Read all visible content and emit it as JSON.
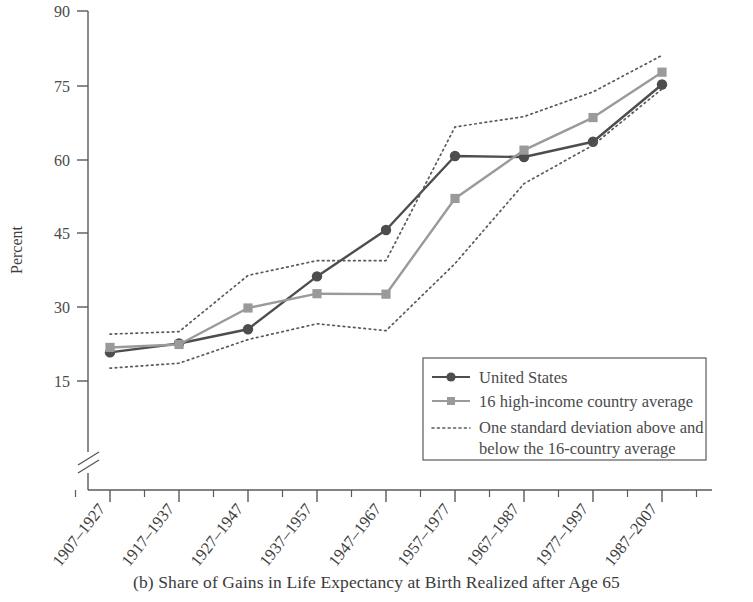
{
  "caption": "(b) Share of Gains in Life Expectancy at Birth Realized after Age 65",
  "axis": {
    "ylabel": "Percent",
    "yticks": [
      "15",
      "30",
      "45",
      "60",
      "75",
      "90"
    ],
    "break_symbol": "axis-break"
  },
  "legend": {
    "items": [
      {
        "label": "United States",
        "marker": "circle",
        "style": "solid",
        "color": "#4d4d4d"
      },
      {
        "label": "16 high-income country average",
        "marker": "square",
        "style": "solid",
        "color": "#9a9a9a"
      },
      {
        "label": "One standard deviation above and",
        "label2": "below the 16-country average",
        "marker": "none",
        "style": "dotted",
        "color": "#5a5a5a"
      }
    ]
  },
  "chart_data": {
    "type": "line",
    "title": "(b) Share of Gains in Life Expectancy at Birth Realized after Age 65",
    "xlabel": "",
    "ylabel": "Percent",
    "ylim": [
      10,
      90
    ],
    "yticks": [
      15,
      30,
      45,
      60,
      75,
      90
    ],
    "grid": false,
    "legend_position": "bottom-right",
    "axis_break": true,
    "categories": [
      "1907–1927",
      "1917–1937",
      "1927–1947",
      "1937–1957",
      "1947–1967",
      "1957–1977",
      "1967–1987",
      "1977–1997",
      "1987–2007"
    ],
    "series": [
      {
        "name": "United States",
        "marker": "circle",
        "style": "solid",
        "color": "#4d4d4d",
        "values": [
          20.8,
          22.6,
          25.5,
          36.2,
          45.6,
          60.6,
          60.4,
          63.5,
          75.1
        ]
      },
      {
        "name": "16 high-income country average",
        "marker": "square",
        "style": "solid",
        "color": "#9a9a9a",
        "values": [
          21.8,
          22.4,
          29.8,
          32.7,
          32.6,
          52.0,
          61.8,
          68.4,
          77.6
        ]
      },
      {
        "name": "One standard deviation above the 16-country average",
        "marker": "none",
        "style": "dotted",
        "color": "#5a5a5a",
        "values": [
          24.5,
          25.0,
          36.4,
          39.4,
          39.4,
          66.5,
          68.6,
          73.6,
          81.0
        ]
      },
      {
        "name": "One standard deviation below the 16-country average",
        "marker": "none",
        "style": "dotted",
        "color": "#5a5a5a",
        "values": [
          17.6,
          18.6,
          23.4,
          26.6,
          25.2,
          38.8,
          55.0,
          62.8,
          74.2
        ]
      }
    ]
  }
}
